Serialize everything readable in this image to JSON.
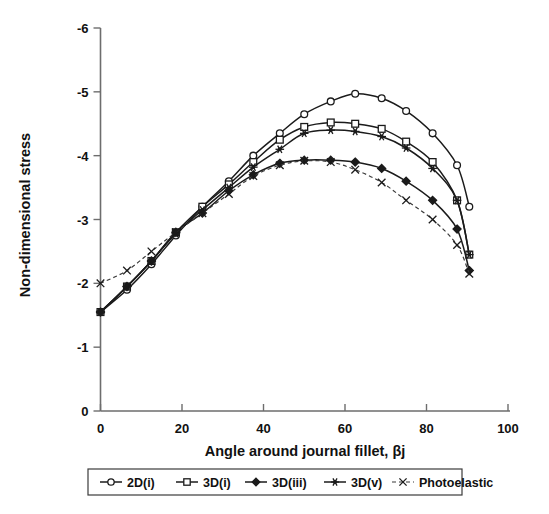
{
  "chart_data": {
    "type": "line",
    "title": "",
    "xlabel": "Angle around journal fillet, βj",
    "ylabel": "Non-dimensional stress",
    "xlim": [
      0,
      100
    ],
    "ylim": [
      0,
      -6
    ],
    "x_ticks": [
      0,
      20,
      40,
      60,
      80,
      100
    ],
    "x_tick_labels": [
      "0",
      "20",
      "40",
      "60",
      "80",
      "100"
    ],
    "y_ticks": [
      0,
      -1,
      -2,
      -3,
      -4,
      -5,
      -6
    ],
    "y_tick_labels": [
      "0",
      "-1",
      "-2",
      "-3",
      "-4",
      "-5",
      "-6"
    ],
    "grid": false,
    "legend_position": "bottom",
    "y_axis_inverted": true,
    "series": [
      {
        "name": "2D(i)",
        "marker": "open-circle",
        "linestyle": "solid",
        "color": "#1b1b1b",
        "x": [
          0,
          6.5,
          12.5,
          18.5,
          25,
          31.5,
          37.5,
          44,
          50,
          56.5,
          62.5,
          69,
          75,
          81.5,
          87.5,
          90.5
        ],
        "y": [
          -1.55,
          -1.9,
          -2.3,
          -2.75,
          -3.2,
          -3.6,
          -4.0,
          -4.35,
          -4.65,
          -4.85,
          -4.97,
          -4.9,
          -4.7,
          -4.35,
          -3.85,
          -3.2
        ]
      },
      {
        "name": "3D(i)",
        "marker": "open-square",
        "linestyle": "solid",
        "color": "#1b1b1b",
        "x": [
          0,
          6.5,
          12.5,
          18.5,
          25,
          31.5,
          37.5,
          44,
          50,
          56.5,
          62.5,
          69,
          75,
          81.5,
          87.5,
          90.5
        ],
        "y": [
          -1.55,
          -1.95,
          -2.35,
          -2.8,
          -3.2,
          -3.55,
          -3.9,
          -4.25,
          -4.45,
          -4.52,
          -4.5,
          -4.42,
          -4.22,
          -3.9,
          -3.3,
          -2.45
        ]
      },
      {
        "name": "3D(iii)",
        "marker": "filled-diamond",
        "linestyle": "solid",
        "color": "#1b1b1b",
        "x": [
          0,
          6.5,
          12.5,
          18.5,
          25,
          31.5,
          37.5,
          44,
          50,
          56.5,
          62.5,
          69,
          75,
          81.5,
          87.5,
          90.5
        ],
        "y": [
          -1.55,
          -1.95,
          -2.35,
          -2.8,
          -3.1,
          -3.45,
          -3.7,
          -3.88,
          -3.93,
          -3.93,
          -3.9,
          -3.8,
          -3.6,
          -3.3,
          -2.85,
          -2.2
        ]
      },
      {
        "name": "3D(v)",
        "marker": "star",
        "linestyle": "solid",
        "color": "#1b1b1b",
        "x": [
          0,
          6.5,
          12.5,
          18.5,
          25,
          31.5,
          37.5,
          44,
          50,
          56.5,
          62.5,
          69,
          75,
          81.5,
          87.5,
          90.5
        ],
        "y": [
          -1.55,
          -1.95,
          -2.35,
          -2.78,
          -3.15,
          -3.5,
          -3.82,
          -4.1,
          -4.35,
          -4.4,
          -4.38,
          -4.3,
          -4.12,
          -3.8,
          -3.3,
          -2.45
        ]
      },
      {
        "name": "Photoelastic",
        "marker": "cross",
        "linestyle": "dashed",
        "color": "#3a3a3a",
        "x": [
          0,
          6.5,
          12.5,
          18.5,
          25,
          31.5,
          37.5,
          44,
          50,
          56.5,
          62.5,
          69,
          75,
          81.5,
          87.5,
          90.5
        ],
        "y": [
          -2.0,
          -2.2,
          -2.5,
          -2.8,
          -3.1,
          -3.4,
          -3.68,
          -3.85,
          -3.92,
          -3.9,
          -3.78,
          -3.58,
          -3.3,
          -3.0,
          -2.6,
          -2.15
        ]
      }
    ]
  },
  "legend": {
    "items": [
      {
        "label": "2D(i)",
        "marker": "open-circle",
        "dashed": false
      },
      {
        "label": "3D(i)",
        "marker": "open-square",
        "dashed": false
      },
      {
        "label": "3D(iii)",
        "marker": "filled-diamond",
        "dashed": false
      },
      {
        "label": "3D(v)",
        "marker": "star",
        "dashed": false
      },
      {
        "label": "Photoelastic",
        "marker": "cross",
        "dashed": true
      }
    ]
  }
}
